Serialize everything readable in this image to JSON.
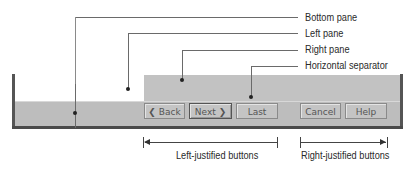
{
  "callouts": {
    "bottom_pane": "Bottom pane",
    "left_pane": "Left pane",
    "right_pane": "Right pane",
    "horizontal_separator": "Horizontal separator"
  },
  "buttons": {
    "back": "❮ Back",
    "next": "Next ❯",
    "last": "Last",
    "cancel": "Cancel",
    "help": "Help"
  },
  "brackets": {
    "left_justified": "Left-justified buttons",
    "right_justified": "Right-justified buttons"
  },
  "colors": {
    "pane_gray": "#bdbdbd",
    "border_dark": "#4a4a4a",
    "callout_line": "#6a6a6a"
  }
}
